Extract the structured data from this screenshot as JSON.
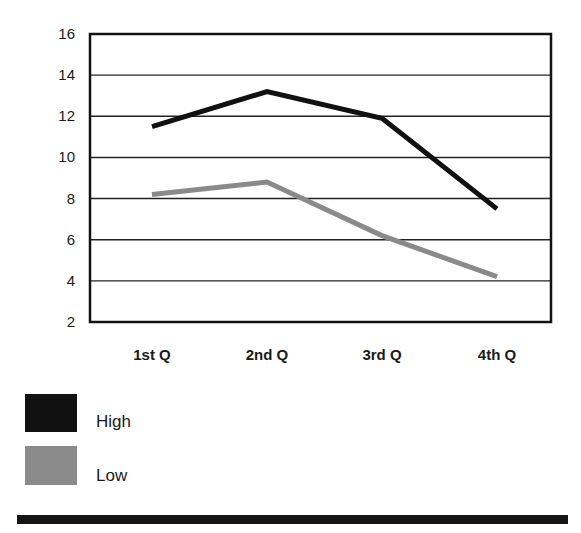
{
  "chart_data": {
    "type": "line",
    "title": "",
    "xlabel": "",
    "ylabel": "",
    "categories": [
      "1st Q",
      "2nd Q",
      "3rd Q",
      "4th Q"
    ],
    "series": [
      {
        "name": "High",
        "values": [
          11.5,
          13.2,
          11.9,
          7.5
        ],
        "color": "#111111"
      },
      {
        "name": "Low",
        "values": [
          8.2,
          8.8,
          6.2,
          4.2
        ],
        "color": "#8a8a8a"
      }
    ],
    "ylim": [
      2,
      16
    ],
    "yticks": [
      2,
      4,
      6,
      8,
      10,
      12,
      14,
      16
    ],
    "grid": true,
    "legend_position": "bottom-left"
  },
  "legend": {
    "items": [
      {
        "label": "High",
        "color": "#111111"
      },
      {
        "label": "Low",
        "color": "#8a8a8a"
      }
    ]
  },
  "footer": {
    "rule_color": "#141414"
  }
}
